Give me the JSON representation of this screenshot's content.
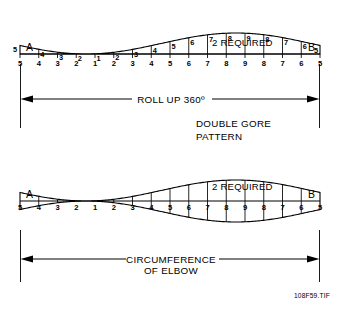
{
  "figure": {
    "caption": "108F59.TIF",
    "background_color": "#ffffff",
    "line_color": "#000000"
  },
  "top_pattern": {
    "name": "roll-up-gore-pattern",
    "required_label": "2 REQUIRED",
    "left_marker": "A",
    "right_marker": "B",
    "left_edge_number": "5",
    "right_edge_number": "5",
    "curve_numbers": [
      "4",
      "3",
      "2",
      "1",
      "2",
      "3",
      "4",
      "5",
      "6",
      "7",
      "8",
      "9",
      "8",
      "7",
      "6"
    ],
    "axis_numbers": [
      "5",
      "4",
      "3",
      "2",
      "1",
      "2",
      "3",
      "4",
      "5",
      "6",
      "7",
      "8",
      "9",
      "8",
      "7",
      "6",
      "5"
    ]
  },
  "bottom_pattern": {
    "name": "double-gore-pattern",
    "required_label": "2 REQUIRED",
    "left_marker": "A",
    "right_marker": "B",
    "axis_numbers": [
      "5",
      "4",
      "3",
      "2",
      "1",
      "2",
      "3",
      "4",
      "5",
      "6",
      "7",
      "8",
      "9",
      "8",
      "7",
      "6",
      "5"
    ]
  },
  "dimensions": {
    "top_label": "ROLL UP 360º",
    "bottom_label_line1": "CIRCUMFERENCE",
    "bottom_label_line2": "OF ELBOW"
  },
  "annotation": {
    "title_line1": "DOUBLE GORE",
    "title_line2": "PATTERN"
  },
  "geometry": {
    "left_x": 20,
    "right_x": 320,
    "top_baseline_y": 54,
    "top_half_amplitude": 21,
    "bottom_center_y": 201,
    "bottom_amplitude": 21
  }
}
